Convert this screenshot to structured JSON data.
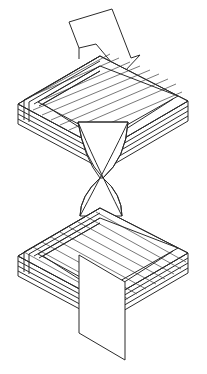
{
  "figure": {
    "title": "Twisted ribbon specimen bonded between two laminated plates",
    "caption": "",
    "background_color": "#ffffff",
    "stroke_color": "#2b2b2b",
    "secondary_stroke_color": "#555555",
    "fill_color": "#ffffff",
    "stroke_width": 1.0,
    "canvas": {
      "width": 207,
      "height": 374
    },
    "projection": "oblique-parallel"
  },
  "diagram": {
    "type": "technical-line-drawing",
    "parts": [
      {
        "id": "load-arrow",
        "name": "upward load arrow",
        "role": "applied-load-indicator",
        "direction": "up",
        "label": ""
      },
      {
        "id": "upper-laminate-plate",
        "name": "upper laminated plate",
        "role": "adherend",
        "ply_count": 4,
        "fiber_orientation": "lower-left to upper-right",
        "label": ""
      },
      {
        "id": "twisted-ribbon",
        "name": "twisted ribbon web",
        "role": "specimen-gauge-section",
        "twist": "180-degree",
        "label": ""
      },
      {
        "id": "lower-laminate-plate",
        "name": "lower laminated plate",
        "role": "adherend",
        "ply_count": 4,
        "fiber_orientation": "upper-left to lower-right",
        "label": ""
      },
      {
        "id": "lower-tab",
        "name": "lower grip tab",
        "role": "fixed-grip",
        "label": ""
      }
    ]
  },
  "geometry": {
    "upper_plate": {
      "top_face": {
        "back": [
          100,
          56
        ],
        "left": [
          18,
          104
        ],
        "front": [
          104,
          150
        ],
        "right": [
          188,
          101
        ]
      },
      "ply_edge_offsets": [
        0,
        5,
        10,
        15,
        20
      ],
      "surface_line_count": 9
    },
    "lower_plate": {
      "top_face": {
        "back": [
          100,
          208
        ],
        "left": [
          18,
          256
        ],
        "front": [
          104,
          302
        ],
        "right": [
          188,
          253
        ]
      },
      "ply_edge_offsets": [
        0,
        5,
        10,
        15,
        20
      ],
      "surface_line_count": 9
    },
    "ribbon": {
      "top_width_left": 78,
      "top_width_right": 128,
      "waist": [
        100,
        178
      ],
      "bottom_width_left": 80,
      "bottom_width_right": 122
    },
    "arrow": {
      "tip": [
        131,
        58
      ],
      "shaft_top": [
        69,
        22
      ],
      "notch": [
        79,
        44
      ]
    },
    "lower_tab": {
      "left": 79,
      "right": 125,
      "top": 255,
      "bottom": 360
    }
  }
}
